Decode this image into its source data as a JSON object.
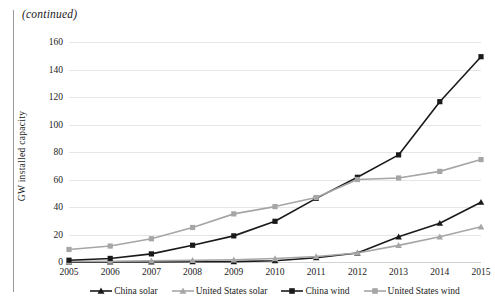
{
  "page": {
    "continued_note": "(continued)",
    "edge_rule": "page-edge-rule"
  },
  "chart_data": {
    "type": "line",
    "title": "",
    "subtitle": "",
    "xlabel": "",
    "ylabel": "GW installed capacity",
    "x": [
      2005,
      2006,
      2007,
      2008,
      2009,
      2010,
      2011,
      2012,
      2013,
      2014,
      2015
    ],
    "categories": [
      "2005",
      "2006",
      "2007",
      "2008",
      "2009",
      "2010",
      "2011",
      "2012",
      "2013",
      "2014",
      "2015"
    ],
    "xlim": [
      2005,
      2015
    ],
    "ylim": [
      0,
      160
    ],
    "yticks": [
      0,
      20,
      40,
      60,
      80,
      100,
      120,
      140,
      160
    ],
    "ytick_labels": [
      "0",
      "20",
      "40",
      "60",
      "80",
      "100",
      "120",
      "140",
      "160"
    ],
    "grid": true,
    "grid_axis": "y",
    "legend_position": "bottom",
    "series": [
      {
        "name": "China solar",
        "color": "#1a1a1a",
        "marker": "triangle",
        "values": [
          0.1,
          0.1,
          0.1,
          0.2,
          0.3,
          0.9,
          3.1,
          6.5,
          18.3,
          28.2,
          43.5
        ]
      },
      {
        "name": "United States solar",
        "color": "#a6a6a6",
        "marker": "triangle",
        "values": [
          0.5,
          0.6,
          0.8,
          1.2,
          1.6,
          2.5,
          4.0,
          6.6,
          12.1,
          18.3,
          25.6
        ]
      },
      {
        "name": "China wind",
        "color": "#1a1a1a",
        "marker": "square",
        "values": [
          1.3,
          2.6,
          5.9,
          12.2,
          19.0,
          29.6,
          46.3,
          61.6,
          77.9,
          116.6,
          149.3
        ]
      },
      {
        "name": "United States wind",
        "color": "#a6a6a6",
        "marker": "square",
        "values": [
          9.1,
          11.6,
          16.9,
          25.1,
          35.0,
          40.3,
          46.9,
          60.0,
          61.1,
          65.9,
          74.5
        ]
      }
    ]
  },
  "legend": {
    "items": [
      {
        "label": "China solar",
        "color": "#1a1a1a",
        "marker": "triangle"
      },
      {
        "label": "United States solar",
        "color": "#a6a6a6",
        "marker": "triangle"
      },
      {
        "label": "China wind",
        "color": "#1a1a1a",
        "marker": "square"
      },
      {
        "label": "United States wind",
        "color": "#a6a6a6",
        "marker": "square"
      }
    ]
  }
}
